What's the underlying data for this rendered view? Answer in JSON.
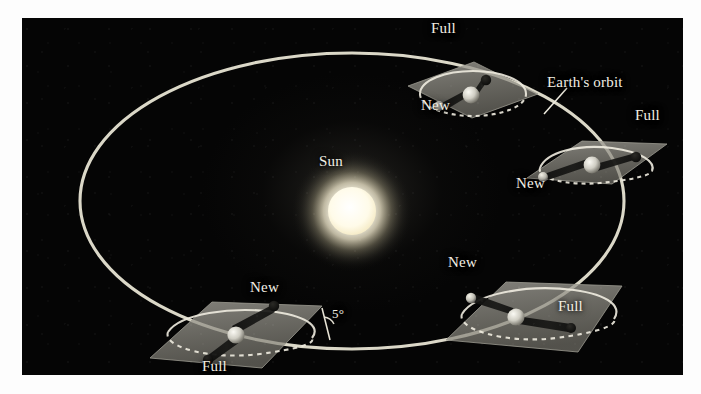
{
  "figure": {
    "kind": "astronomy-diagram",
    "background_color": "#050505",
    "page_color": "#ffffff",
    "label_color": "#f2efe4",
    "orbit_color": "#e8e4d2",
    "panel_color": "#8f8d84",
    "sun_color": "#fffdf2"
  },
  "sun": {
    "label": "Sun"
  },
  "orbit": {
    "label": "Earth's orbit"
  },
  "inclination": {
    "label": "5°"
  },
  "panels": [
    {
      "name": "top-panel",
      "labels": [
        {
          "text": "Full",
          "corner": "upper-left"
        },
        {
          "text": "New",
          "corner": "lower-left"
        }
      ]
    },
    {
      "name": "right-panel",
      "labels": [
        {
          "text": "Full",
          "corner": "upper-right"
        },
        {
          "text": "New",
          "corner": "lower-left"
        }
      ]
    },
    {
      "name": "bottom-right-panel",
      "labels": [
        {
          "text": "New",
          "corner": "upper-left"
        },
        {
          "text": "Full",
          "corner": "right"
        }
      ]
    },
    {
      "name": "bottom-left-panel",
      "labels": [
        {
          "text": "New",
          "corner": "upper-right"
        },
        {
          "text": "Full",
          "corner": "lower-left"
        }
      ]
    }
  ]
}
